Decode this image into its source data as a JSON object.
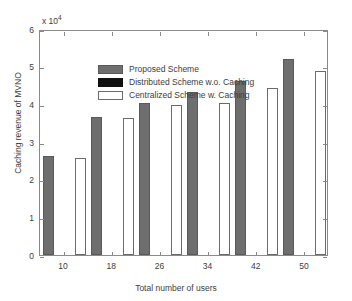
{
  "chart_data": {
    "type": "bar",
    "title": "",
    "xlabel": "Total number of users",
    "ylabel": "Caching revenue of MVNO",
    "y_exponent_label": "x 10",
    "y_exponent_power": "4",
    "y_tick_labels": [
      "0",
      "1",
      "2",
      "3",
      "4",
      "5",
      "6"
    ],
    "y_tick_values": [
      0,
      1,
      2,
      3,
      4,
      5,
      6
    ],
    "ylim": [
      0,
      6
    ],
    "grid": false,
    "legend_position": "upper left",
    "categories": [
      "10",
      "18",
      "26",
      "34",
      "42",
      "50"
    ],
    "x_tick_labels": [
      "10",
      "18",
      "26",
      "34",
      "42",
      "50"
    ],
    "series": [
      {
        "name": "Proposed Scheme",
        "color": "#6e6e6e",
        "values": [
          2.63,
          3.66,
          4.04,
          4.33,
          4.62,
          5.2
        ]
      },
      {
        "name": "Distributed Scheme w.o. Caching",
        "color": "#111111",
        "values": [
          0,
          0,
          0,
          0,
          0,
          0
        ]
      },
      {
        "name": "Centralized Scheme w. Caching",
        "color": "#ffffff",
        "values": [
          2.58,
          3.65,
          3.98,
          4.04,
          4.43,
          4.88
        ]
      }
    ]
  },
  "legend": {
    "entries": [
      {
        "label": "Proposed Scheme"
      },
      {
        "label": "Distributed Scheme w.o. Caching"
      },
      {
        "label": "Centralized Scheme w. Caching"
      }
    ]
  },
  "axes": {
    "y_exponent": "x 10",
    "y_exponent_sup": "4",
    "y_title": "Caching revenue of MVNO",
    "x_title": "Total number of users"
  }
}
